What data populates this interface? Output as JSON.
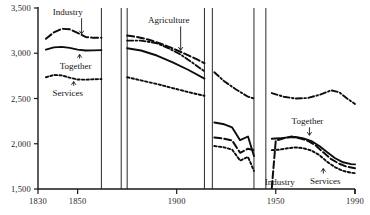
{
  "figure": {
    "background": "#ffffff",
    "ink_color": "#0d0d0d"
  },
  "chart_data": {
    "type": "line",
    "title": "",
    "subtitle": "",
    "xlabel": "",
    "ylabel": "",
    "xlim": [
      1830,
      1990
    ],
    "ylim": [
      1500,
      3500
    ],
    "grid": false,
    "legend": "annotations-inline",
    "xticks": [
      1830,
      1850,
      1900,
      1950,
      1990
    ],
    "xtick_labels": [
      "1830",
      "1850",
      "1900",
      "1950",
      "1990"
    ],
    "yticks": [
      1500,
      2000,
      2500,
      3000,
      3500
    ],
    "ytick_labels": [
      "1,500",
      "2,000",
      "2,500",
      "3,000",
      "3,500"
    ],
    "breaks": [
      1862,
      1872,
      1875,
      1914,
      1918,
      1939,
      1945
    ],
    "annotations": [
      {
        "label": "Industry",
        "x": 1845,
        "y": 3420,
        "arrow_to_x": 1852,
        "arrow_to_y": 3180
      },
      {
        "label": "Together",
        "x": 1849,
        "y": 2830,
        "arrow_to_x": 1851,
        "arrow_to_y": 3020
      },
      {
        "label": "Services",
        "x": 1845,
        "y": 2530,
        "arrow_to_x": 1848,
        "arrow_to_y": 2720
      },
      {
        "label": "Agriculture",
        "x": 1896,
        "y": 3330,
        "arrow_to_x": 1902,
        "arrow_to_y": 3000
      },
      {
        "label": "Together",
        "x": 1966,
        "y": 2215,
        "arrow_to_x": 1967,
        "arrow_to_y": 2060
      },
      {
        "label": "Industry",
        "x": 1952,
        "y": 1545,
        "arrow_to_x": 1952,
        "arrow_to_y": 1545
      },
      {
        "label": "Services",
        "x": 1975,
        "y": 1560,
        "arrow_to_x": 1974,
        "arrow_to_y": 1760
      }
    ],
    "series": [
      {
        "name": "Industry",
        "style": "long-dash",
        "segments": [
          {
            "x": [
              1834,
              1838,
              1842,
              1846,
              1850,
              1854,
              1858,
              1862
            ],
            "y": [
              3160,
              3230,
              3270,
              3265,
              3225,
              3180,
              3170,
              3172
            ]
          },
          {
            "x": [
              1875,
              1880,
              1886,
              1892,
              1898,
              1904,
              1910,
              1914
            ],
            "y": [
              3195,
              3180,
              3150,
              3105,
              3055,
              2995,
              2935,
              2890
            ]
          },
          {
            "x": [
              1919,
              1924,
              1928,
              1932,
              1936,
              1939
            ],
            "y": [
              2070,
              2055,
              2035,
              1900,
              1945,
              1930
            ]
          },
          {
            "x": [
              1948,
              1950,
              1954,
              1958,
              1962,
              1966,
              1970,
              1974,
              1978,
              1982,
              1986,
              1990
            ],
            "y": [
              1510,
              2035,
              2060,
              2080,
              2060,
              2035,
              1985,
              1905,
              1830,
              1780,
              1745,
              1730
            ]
          }
        ]
      },
      {
        "name": "Services",
        "style": "short-dash",
        "segments": [
          {
            "x": [
              1834,
              1838,
              1842,
              1846,
              1850,
              1854,
              1858,
              1862
            ],
            "y": [
              2735,
              2760,
              2755,
              2730,
              2710,
              2708,
              2712,
              2715
            ]
          },
          {
            "x": [
              1875,
              1882,
              1890,
              1898,
              1906,
              1914
            ],
            "y": [
              2735,
              2700,
              2660,
              2615,
              2570,
              2530
            ]
          },
          {
            "x": [
              1919,
              1924,
              1928,
              1932,
              1936,
              1939
            ],
            "y": [
              1975,
              1960,
              1935,
              1815,
              1855,
              1700
            ]
          },
          {
            "x": [
              1948,
              1952,
              1956,
              1960,
              1964,
              1968,
              1972,
              1976,
              1980,
              1984,
              1988,
              1990
            ],
            "y": [
              1930,
              1935,
              1950,
              1960,
              1950,
              1925,
              1875,
              1800,
              1740,
              1700,
              1680,
              1675
            ]
          }
        ]
      },
      {
        "name": "Agriculture",
        "style": "dash-dot",
        "segments": [
          {
            "x": [
              1875,
              1882,
              1890,
              1896,
              1902,
              1908,
              1914
            ],
            "y": [
              3140,
              3140,
              3110,
              3055,
              2985,
              2895,
              2800
            ]
          },
          {
            "x": [
              1919,
              1924,
              1930,
              1936,
              1939
            ],
            "y": [
              2790,
              2690,
              2600,
              2520,
              2500
            ]
          },
          {
            "x": [
              1948,
              1954,
              1960,
              1966,
              1972,
              1978,
              1982,
              1986,
              1990
            ],
            "y": [
              2560,
              2520,
              2500,
              2505,
              2540,
              2590,
              2570,
              2500,
              2440
            ]
          }
        ]
      },
      {
        "name": "Together",
        "style": "solid",
        "segments": [
          {
            "x": [
              1834,
              1838,
              1842,
              1846,
              1850,
              1854,
              1858,
              1862
            ],
            "y": [
              3040,
              3065,
              3070,
              3060,
              3040,
              3030,
              3032,
              3035
            ]
          },
          {
            "x": [
              1875,
              1882,
              1890,
              1898,
              1906,
              1914
            ],
            "y": [
              3055,
              3030,
              2975,
              2900,
              2815,
              2720
            ]
          },
          {
            "x": [
              1919,
              1924,
              1928,
              1932,
              1936,
              1939
            ],
            "y": [
              2235,
              2215,
              2180,
              2040,
              2080,
              1865
            ]
          },
          {
            "x": [
              1948,
              1952,
              1956,
              1960,
              1964,
              1968,
              1972,
              1976,
              1980,
              1984,
              1988,
              1990
            ],
            "y": [
              2055,
              2060,
              2070,
              2075,
              2060,
              2030,
              1975,
              1905,
              1840,
              1795,
              1775,
              1772
            ]
          }
        ]
      }
    ]
  }
}
